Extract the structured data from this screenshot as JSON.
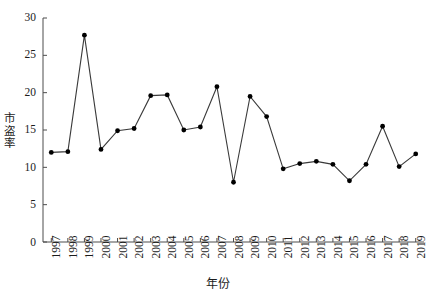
{
  "chart_data": {
    "type": "line",
    "title": "",
    "xlabel": "年份",
    "ylabel": "市盗率",
    "ylim": [
      0,
      30
    ],
    "yticks": [
      0,
      5,
      10,
      15,
      20,
      25,
      30
    ],
    "grid": false,
    "legend": "none",
    "marker": "filled-circle",
    "line_color": "#333333",
    "marker_color": "#000000",
    "categories": [
      "1997",
      "1998",
      "1999",
      "2000",
      "2001",
      "2002",
      "2003",
      "2004",
      "2005",
      "2006",
      "2007",
      "2008",
      "2009",
      "2010",
      "2011",
      "2012",
      "2013",
      "2014",
      "2015",
      "2016",
      "2017",
      "2018",
      "2019"
    ],
    "values": [
      12.0,
      12.1,
      27.7,
      12.4,
      14.9,
      15.2,
      19.6,
      19.7,
      15.0,
      15.4,
      20.8,
      8.0,
      19.5,
      16.8,
      9.8,
      10.5,
      10.8,
      10.4,
      8.2,
      10.4,
      15.5,
      10.1,
      11.8
    ],
    "series": [
      {
        "name": "市盗率",
        "values": [
          12.0,
          12.1,
          27.7,
          12.4,
          14.9,
          15.2,
          19.6,
          19.7,
          15.0,
          15.4,
          20.8,
          8.0,
          19.5,
          16.8,
          9.8,
          10.5,
          10.8,
          10.4,
          8.2,
          10.4,
          15.5,
          10.1,
          11.8
        ]
      }
    ]
  }
}
